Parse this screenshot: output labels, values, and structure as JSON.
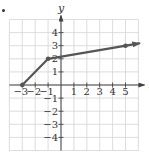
{
  "chart_data": {
    "type": "line",
    "title": "",
    "xlabel": "x",
    "ylabel": "y",
    "xlim": [
      -4,
      6
    ],
    "ylim": [
      -5,
      5
    ],
    "grid": true,
    "x_ticks": [
      -3,
      -2,
      -1,
      1,
      2,
      3,
      4,
      5
    ],
    "y_ticks": [
      4,
      3,
      2,
      1,
      -1,
      -2,
      -3,
      -4
    ],
    "x_tick_labels": [
      "−3",
      "−2",
      "−1",
      "1",
      "2",
      "3",
      "4",
      "5"
    ],
    "y_tick_labels": [
      "4",
      "3",
      "2",
      "1",
      "−1",
      "−2",
      "−3",
      "−4"
    ],
    "series": [
      {
        "name": "piecewise graph",
        "points": [
          [
            -3,
            0
          ],
          [
            -1,
            2
          ],
          [
            5,
            3
          ]
        ],
        "closed_dots": [
          [
            -3,
            0
          ],
          [
            -1,
            2
          ],
          [
            5,
            3
          ]
        ],
        "arrow_end": true,
        "color": "#555555"
      }
    ],
    "legend": null
  },
  "colors": {
    "grid": "#d4d4d4",
    "axis": "#444444",
    "line": "#555555",
    "text": "#333333"
  }
}
